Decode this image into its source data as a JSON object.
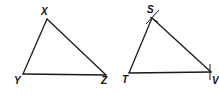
{
  "diagram": {
    "triangles": [
      {
        "name": "XYZ",
        "vertices": [
          {
            "label": "X"
          },
          {
            "label": "Y"
          },
          {
            "label": "Z"
          }
        ]
      },
      {
        "name": "STV",
        "vertices": [
          {
            "label": "S"
          },
          {
            "label": "T"
          },
          {
            "label": "V"
          }
        ],
        "construction_marks": [
          "S",
          "V"
        ]
      }
    ],
    "colors": {
      "stroke": "#1a1a1a",
      "background": "#ffffff"
    }
  }
}
